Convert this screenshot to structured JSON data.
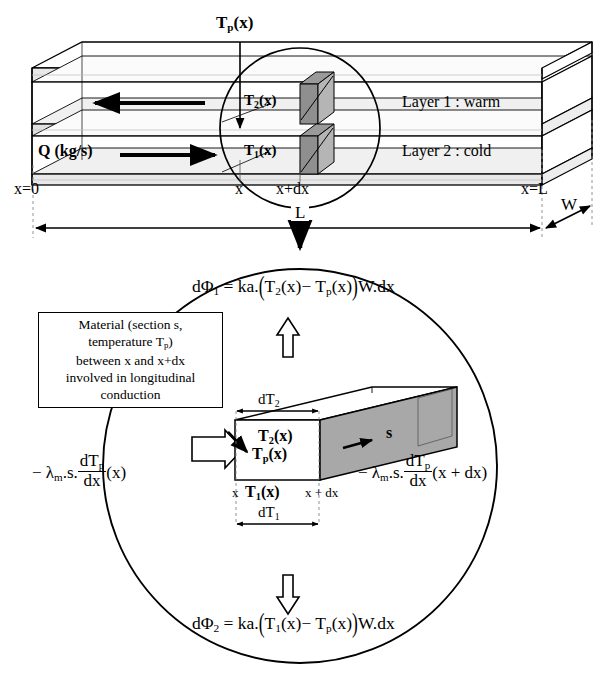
{
  "figure": {
    "type": "technical-diagram"
  },
  "top_diagram": {
    "name": "duct-overview",
    "labels": {
      "tp": "T",
      "tp_sub": "p",
      "tp_arg": "(x)",
      "t2": "T",
      "t2_sub": "2",
      "t2_arg": "(x)",
      "t1": "T",
      "t1_sub": "1",
      "t1_arg": "(x)",
      "flow": "Q (kg/s)",
      "layer1": "Layer 1 : warm",
      "layer2": "Layer 2 : cold",
      "x0": "x=0",
      "x": "x",
      "xdx": "x+dx",
      "xL": "x=L",
      "length": "L",
      "width": "W"
    }
  },
  "detail_diagram": {
    "name": "detail-circle",
    "material_box": {
      "line1": "Material (section s,",
      "line2_prefix": "temperature T",
      "line2_sub": "p",
      "line2_suffix": ")",
      "line3": "between x and x+dx",
      "line4": "involved in longitudinal",
      "line5": "conduction"
    },
    "eq_top": {
      "lhs": "dΦ",
      "lhs_sub": "1",
      "eq": " = ka.",
      "open": "(",
      "t2": "T",
      "t2_sub": "2",
      "t2_arg": "(x)",
      "minus": "− ",
      "tp": "T",
      "tp_sub": "p",
      "tp_arg": "(x)",
      "close": ")",
      "tail": "W.dx"
    },
    "eq_bottom": {
      "lhs": "dΦ",
      "lhs_sub": "2",
      "eq": " = ka.",
      "open": "(",
      "t1": "T",
      "t1_sub": "1",
      "t1_arg": "(x)",
      "minus": "− ",
      "tp": "T",
      "tp_sub": "p",
      "tp_arg": "(x)",
      "close": ")",
      "tail": "W.dx"
    },
    "eq_left": {
      "minus": "− ",
      "lambda": "λ",
      "lambda_sub": "m",
      "dot_s": ".s.",
      "num": "dT",
      "num_sub": "p",
      "den": "dx",
      "arg": "(x)"
    },
    "eq_right": {
      "minus": "− ",
      "lambda": "λ",
      "lambda_sub": "m",
      "dot_s": ".s.",
      "num": "dT",
      "num_sub": "p",
      "den": "dx",
      "arg": "(x + dx)"
    },
    "block_labels": {
      "dT2": "dT",
      "dT2_sub": "2",
      "dT1": "dT",
      "dT1_sub": "1",
      "t2": "T",
      "t2_sub": "2",
      "t2_arg": "(x)",
      "tp": "T",
      "tp_sub": "p",
      "tp_arg": "(x)",
      "t1": "T",
      "t1_sub": "1",
      "t1_arg": "(x)",
      "section": "s",
      "x_left": "x",
      "x_right": "x + dx"
    }
  },
  "colors": {
    "ink": "#000000",
    "paper": "#ffffff",
    "shade_light": "#d9d9d9",
    "shade_mid": "#a8a8a8",
    "shade_dark": "#8c8c8c"
  }
}
